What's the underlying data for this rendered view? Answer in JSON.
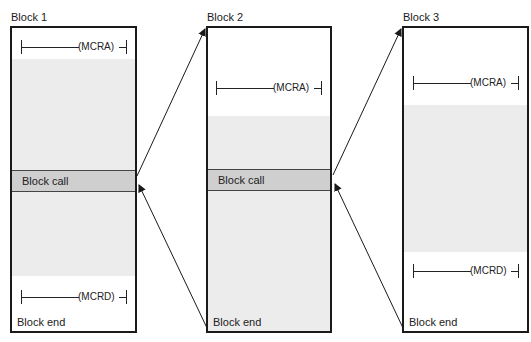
{
  "diagram": {
    "blocks": [
      {
        "title": "Block 1",
        "top_rung": {
          "coil": "(MCRA)"
        },
        "call_label": "Block call",
        "bottom_rung": {
          "coil": "(MCRD)"
        },
        "end_label": "Block end"
      },
      {
        "title": "Block 2",
        "top_rung": {
          "coil": "(MCRA)"
        },
        "call_label": "Block call",
        "end_label": "Block end"
      },
      {
        "title": "Block 3",
        "top_rung": {
          "coil": "(MCRA)"
        },
        "bottom_rung": {
          "coil": "(MCRD)"
        },
        "end_label": "Block end"
      }
    ],
    "arrows": [
      {
        "from": "Block 1 call",
        "to": "Block 2 start"
      },
      {
        "from": "Block 2 end",
        "to": "Block 1 return"
      },
      {
        "from": "Block 2 call",
        "to": "Block 3 start"
      },
      {
        "from": "Block 3 end",
        "to": "Block 2 return"
      }
    ],
    "colors": {
      "shade": "#ececec",
      "call_band": "#cfcfcf",
      "line": "#1a1a1a"
    }
  }
}
